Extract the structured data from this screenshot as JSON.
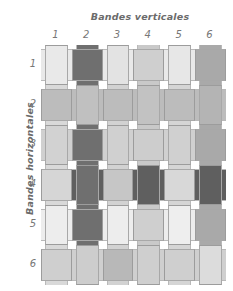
{
  "figure": {
    "title_top": "Bandes verticales",
    "title_left": "Bandes horizontales",
    "column_labels": [
      "1",
      "2",
      "3",
      "4",
      "5",
      "6"
    ],
    "row_labels": [
      "1",
      "2",
      "3",
      "4",
      "5",
      "6"
    ]
  },
  "chart_data": {
    "type": "heatmap",
    "title": "Bandes verticales",
    "xlabel": "Bandes verticales",
    "ylabel": "Bandes horizontales",
    "categories": [
      "1",
      "2",
      "3",
      "4",
      "5",
      "6"
    ],
    "row_categories": [
      "1",
      "2",
      "3",
      "4",
      "5",
      "6"
    ],
    "vertical_strip_colors": [
      "#d9d9d9",
      "#6f6f6f",
      "#d2d2d2",
      "#c9c9c9",
      "#d5d5d5",
      "#a9a9a9"
    ],
    "horizontal_strip_colors": [
      "#e9e9e9",
      "#bcbcbc",
      "#d0d0d0",
      "#5f5f5f",
      "#ededed",
      "#cfcfcf"
    ],
    "over_under_rule": "vertical strip passes over when (row + column) is even",
    "cell_colors": [
      [
        "#e9e9e9",
        "#6f6f6f",
        "#e3e3e3",
        "#cfcfcf",
        "#e7e7e7",
        "#a9a9a9"
      ],
      [
        "#bcbcbc",
        "#c0c0c0",
        "#bcbcbc",
        "#c2c2c2",
        "#bcbcbc",
        "#b4b4b4"
      ],
      [
        "#d2d2d2",
        "#6f6f6f",
        "#d0d0d0",
        "#cdcdcd",
        "#d0d0d0",
        "#a9a9a9"
      ],
      [
        "#d6d6d6",
        "#6f6f6f",
        "#c6c6c6",
        "#5f5f5f",
        "#d8d8d8",
        "#5f5f5f"
      ],
      [
        "#ededed",
        "#6f6f6f",
        "#ededed",
        "#cfcfcf",
        "#eeeeee",
        "#a9a9a9"
      ],
      [
        "#cfcfcf",
        "#cdcdcd",
        "#b8b8b8",
        "#cfcfcf",
        "#cfcfcf",
        "#dcdcdc"
      ]
    ],
    "grid": false,
    "legend": "none"
  },
  "geometry": {
    "grid_left": 41,
    "grid_top": 45,
    "cell_width": 30.8,
    "cell_height": 40.0,
    "strip_inset": 4
  }
}
